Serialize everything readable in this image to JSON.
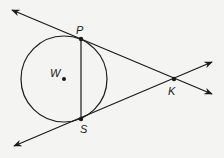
{
  "diagram": {
    "type": "geometry",
    "colors": {
      "background": "#f4f4f2",
      "stroke": "#1a1a1a"
    },
    "circle": {
      "center_label": "W",
      "cx": 64,
      "cy": 79,
      "r": 43
    },
    "points": [
      {
        "label": "P",
        "x": 81,
        "y": 39
      },
      {
        "label": "S",
        "x": 81,
        "y": 119
      },
      {
        "label": "K",
        "x": 174,
        "y": 79
      },
      {
        "label": "W",
        "x": 64,
        "y": 79
      }
    ],
    "segments": [
      {
        "from": "P",
        "to": "S"
      }
    ],
    "rays": [
      {
        "name": "tangent-PK",
        "through": [
          "P",
          "K"
        ],
        "bidirectional": true
      },
      {
        "name": "tangent-SK",
        "through": [
          "S",
          "K"
        ],
        "bidirectional": true
      }
    ],
    "labels": {
      "P": "P",
      "S": "S",
      "K": "K",
      "W": "W"
    }
  }
}
